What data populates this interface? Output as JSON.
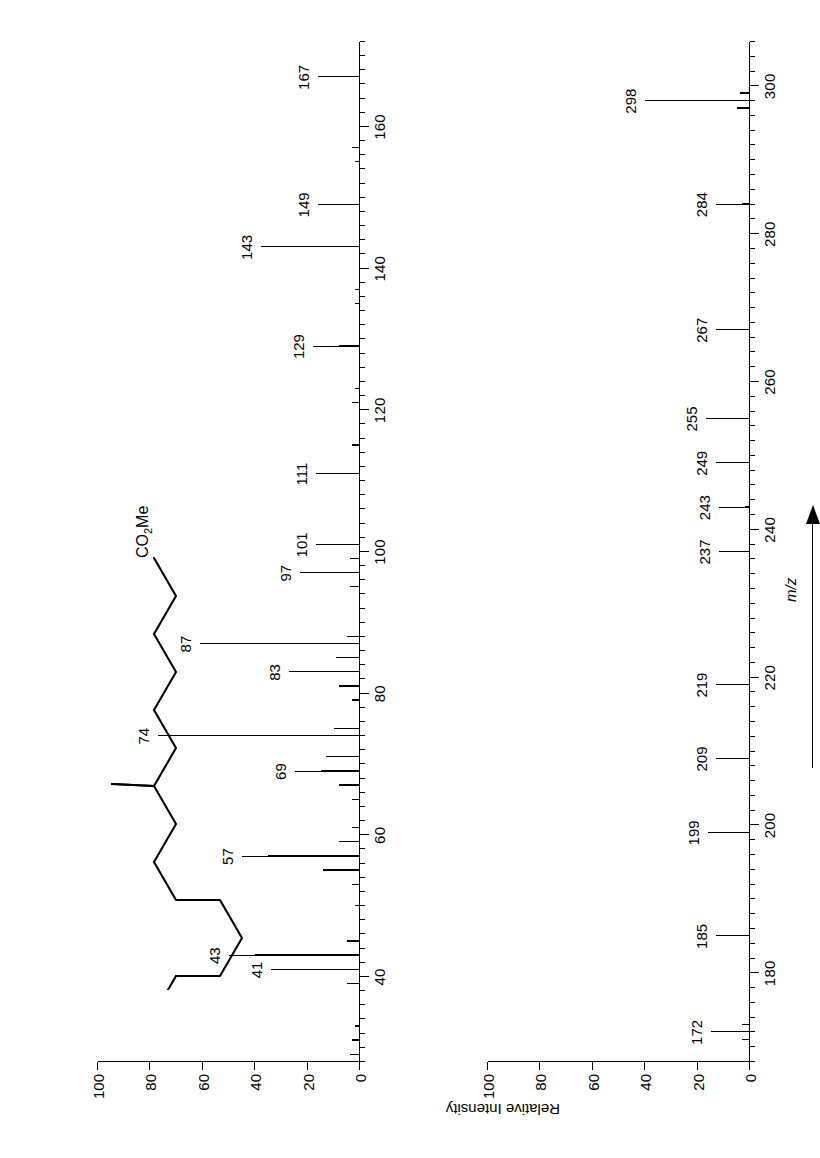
{
  "figure": {
    "kind": "mass-spectrum",
    "yaxis_label": "Relative Intensity",
    "xaxis_label": "m/z",
    "structure_formula_main": "CO",
    "structure_formula_sub": "2",
    "structure_formula_tail": "Me",
    "structure_name": "branched-chain fatty acid methyl ester"
  },
  "yticks": [
    "0",
    "20",
    "40",
    "60",
    "80",
    "100"
  ],
  "ytick_values": [
    0,
    20,
    40,
    60,
    80,
    100
  ],
  "chart_data": [
    {
      "type": "bar",
      "name": "low-mass-panel",
      "title": "",
      "xlabel": "m/z",
      "ylabel": "Relative Intensity",
      "xlim": [
        28,
        172
      ],
      "ylim": [
        0,
        100
      ],
      "grid": false,
      "legend": "none",
      "xticks_major": [
        40,
        60,
        80,
        100,
        120,
        140,
        160
      ],
      "xticks_major_labels": [
        "40",
        "60",
        "80",
        "100",
        "120",
        "140",
        "160"
      ],
      "xtick_minor_step": 2,
      "x": [
        29,
        31,
        33,
        39,
        41,
        43,
        45,
        50,
        53,
        55,
        57,
        59,
        61,
        65,
        67,
        69,
        71,
        74,
        75,
        79,
        81,
        83,
        85,
        87,
        88,
        95,
        97,
        99,
        101,
        111,
        115,
        121,
        123,
        129,
        135,
        137,
        143,
        149,
        155,
        157,
        167
      ],
      "values": [
        4,
        3,
        2,
        5,
        24,
        40,
        5,
        2,
        3,
        14,
        35,
        8,
        3,
        3,
        8,
        15,
        13,
        67,
        10,
        3,
        8,
        17,
        9,
        51,
        5,
        4,
        13,
        4,
        7,
        7,
        3,
        3,
        2,
        8,
        2,
        2,
        28,
        6,
        2,
        3,
        6
      ],
      "labeled_peaks": [
        {
          "mz": 41,
          "label": "41"
        },
        {
          "mz": 43,
          "label": "43"
        },
        {
          "mz": 57,
          "label": "57"
        },
        {
          "mz": 69,
          "label": "69"
        },
        {
          "mz": 74,
          "label": "74"
        },
        {
          "mz": 83,
          "label": "83"
        },
        {
          "mz": 87,
          "label": "87"
        },
        {
          "mz": 97,
          "label": "97"
        },
        {
          "mz": 101,
          "label": "101"
        },
        {
          "mz": 111,
          "label": "111"
        },
        {
          "mz": 129,
          "label": "129"
        },
        {
          "mz": 143,
          "label": "143"
        },
        {
          "mz": 149,
          "label": "149"
        },
        {
          "mz": 167,
          "label": "167"
        }
      ]
    },
    {
      "type": "bar",
      "name": "high-mass-panel",
      "title": "",
      "xlabel": "m/z",
      "ylabel": "Relative Intensity",
      "xlim": [
        168,
        306
      ],
      "ylim": [
        0,
        100
      ],
      "grid": false,
      "legend": "none",
      "xticks_major": [
        180,
        200,
        220,
        240,
        260,
        280,
        300
      ],
      "xticks_major_labels": [
        "180",
        "200",
        "220",
        "240",
        "260",
        "280",
        "300"
      ],
      "xtick_minor_step": 2,
      "x": [
        171,
        172,
        173,
        185,
        199,
        209,
        219,
        237,
        243,
        249,
        255,
        267,
        284,
        297,
        298,
        299
      ],
      "values": [
        3,
        5,
        3,
        3,
        6,
        3,
        3,
        2,
        2,
        3,
        7,
        3,
        3,
        5,
        30,
        4
      ],
      "labeled_peaks": [
        {
          "mz": 172,
          "label": "172"
        },
        {
          "mz": 185,
          "label": "185"
        },
        {
          "mz": 199,
          "label": "199"
        },
        {
          "mz": 209,
          "label": "209"
        },
        {
          "mz": 219,
          "label": "219"
        },
        {
          "mz": 237,
          "label": "237"
        },
        {
          "mz": 243,
          "label": "243"
        },
        {
          "mz": 249,
          "label": "249"
        },
        {
          "mz": 255,
          "label": "255"
        },
        {
          "mz": 267,
          "label": "267"
        },
        {
          "mz": 284,
          "label": "284"
        },
        {
          "mz": 298,
          "label": "298"
        }
      ]
    }
  ]
}
